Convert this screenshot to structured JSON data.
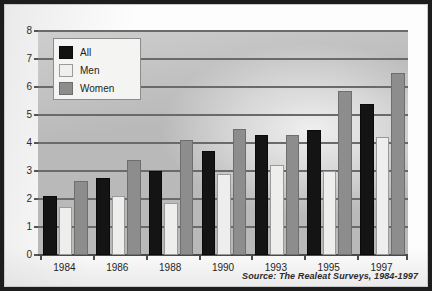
{
  "chart_data": {
    "type": "bar",
    "title": "",
    "subtitle": "",
    "xlabel": "",
    "ylabel": "",
    "categories": [
      "1984",
      "1986",
      "1988",
      "1990",
      "1993",
      "1995",
      "1997"
    ],
    "series": [
      {
        "name": "All",
        "color": "#141414",
        "values": [
          2.1,
          2.75,
          3.0,
          3.7,
          4.3,
          4.45,
          5.4
        ]
      },
      {
        "name": "Men",
        "color": "#eeeeec",
        "values": [
          1.7,
          2.1,
          1.85,
          2.9,
          3.2,
          3.0,
          4.2
        ]
      },
      {
        "name": "Women",
        "color": "#8d8d8d",
        "values": [
          2.65,
          3.4,
          4.1,
          4.5,
          4.3,
          5.85,
          6.5
        ]
      }
    ],
    "ylim": [
      0,
      8
    ],
    "yticks": [
      0,
      1,
      2,
      3,
      4,
      5,
      6,
      7,
      8
    ],
    "ytick_labels": [
      "0",
      "1",
      "2",
      "3",
      "4",
      "5",
      "6",
      "7",
      "8"
    ],
    "grid": true,
    "legend_position": "upper-left-inside",
    "annotations": [
      "Source: The Realeat Surveys, 1984-1997"
    ]
  },
  "legend": {
    "items": [
      {
        "label": "All",
        "swatch": "swatch-black"
      },
      {
        "label": "Men",
        "swatch": "swatch-white"
      },
      {
        "label": "Women",
        "swatch": "swatch-gray"
      }
    ]
  },
  "source": {
    "text": "Source: The Realeat Surveys, 1984-1997"
  },
  "colors": {
    "plot_background": "#b9b9b9",
    "gridline": "#6a6a6a",
    "series_all": "#141414",
    "series_men": "#eeeeec",
    "series_women": "#8d8d8d",
    "frame": "#1d1d1d"
  }
}
